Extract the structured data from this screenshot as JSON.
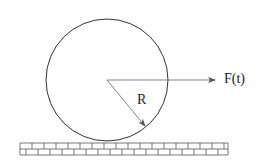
{
  "diagram": {
    "type": "physics-diagram",
    "labels": {
      "force": "F(t)",
      "radius": "R"
    },
    "colors": {
      "stroke": "#333333",
      "background": "#ffffff"
    },
    "wheel": {
      "cx": 107,
      "cy": 80,
      "r": 61
    },
    "force_arrow": {
      "x1": 107,
      "y1": 80,
      "x2": 215,
      "y2": 80
    },
    "radius_arrow": {
      "x1": 107,
      "y1": 80,
      "x2": 145,
      "y2": 126
    },
    "ground": {
      "x": 20,
      "y": 143,
      "width": 208,
      "row_height": 6,
      "rows": 2,
      "brick_width": 12
    }
  }
}
